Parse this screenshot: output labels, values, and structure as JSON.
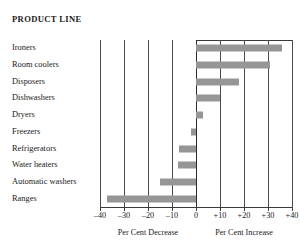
{
  "header": {
    "title": "PRODUCT LINE"
  },
  "axis": {
    "left_caption": "Per Cent Decrease",
    "right_caption": "Per Cent Increase",
    "tick_labels": [
      "–40",
      "–30",
      "–20",
      "–10",
      "0",
      "+10",
      "+20",
      "+30",
      "+40"
    ]
  },
  "colors": {
    "bar": "#969696",
    "gridline": "#4a4a4a",
    "axis": "#3a3a3a",
    "text": "#1a1a1a",
    "background": "#ffffff"
  },
  "chart_data": {
    "type": "bar",
    "orientation": "horizontal",
    "title": "PRODUCT LINE",
    "xlabel": "Per Cent Decrease / Per Cent Increase",
    "ylabel": "Product Line",
    "xlim": [
      -40,
      40
    ],
    "xticks": [
      -40,
      -30,
      -20,
      -10,
      0,
      10,
      20,
      30,
      40
    ],
    "xtick_labels": [
      "–40",
      "–30",
      "–20",
      "–10",
      "0",
      "+10",
      "+20",
      "+30",
      "+40"
    ],
    "grid": true,
    "legend": "none",
    "categories": [
      "Ironers",
      "Room coolers",
      "Disposers",
      "Dishwashers",
      "Dryers",
      "Freezers",
      "Refrigerators",
      "Water heaters",
      "Automatic washers",
      "Ranges"
    ],
    "values": [
      36,
      31,
      18,
      10,
      3,
      -2,
      -7,
      -7.5,
      -15,
      -37
    ],
    "annotations": {
      "left_axis_caption": "Per Cent Decrease",
      "right_axis_caption": "Per Cent Increase"
    }
  }
}
